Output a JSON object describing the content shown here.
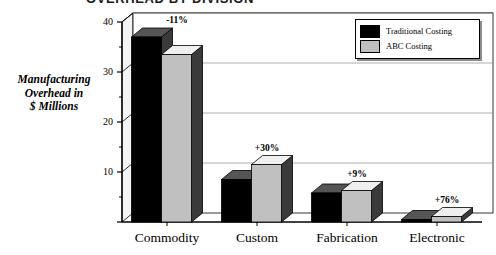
{
  "chart_data": {
    "type": "bar",
    "title": "OVERHEAD BY DIVISION",
    "xlabel": "",
    "ylabel": "Manufacturing Overhead in $ Millions",
    "ylabel_lines": [
      "Manufacturing",
      "Overhead in",
      "$ Millions"
    ],
    "categories": [
      "Commodity",
      "Custom",
      "Fabrication",
      "Electronic"
    ],
    "series": [
      {
        "name": "Traditional Costing",
        "color": "#000000",
        "values": [
          37,
          8.5,
          5.8,
          0.5
        ]
      },
      {
        "name": "ABC Costing",
        "color": "#c0c0c0",
        "values": [
          33.5,
          11.5,
          6.3,
          1.1
        ]
      }
    ],
    "annotations": [
      "-11%",
      "+30%",
      "+9%",
      "+76%"
    ],
    "ylim": [
      0,
      40
    ],
    "yticks": [
      0,
      10,
      20,
      30,
      40
    ],
    "ytick_labels": [
      "",
      "10",
      "20",
      "30",
      "40"
    ],
    "yminor_ticks": [
      5,
      15,
      25,
      35
    ],
    "grid": true,
    "grid_axis": "y",
    "legend_position": "top-right",
    "style": "3d-bars"
  },
  "legend": {
    "items": [
      {
        "label": "Traditional Costing",
        "swatch": "#000000"
      },
      {
        "label": "ABC Costing",
        "swatch": "#c0c0c0"
      }
    ]
  },
  "colors": {
    "traditional": "#000000",
    "abc": "#c0c0c0",
    "grid": "#9a9a9a",
    "axis": "#000000",
    "background": "#ffffff"
  }
}
